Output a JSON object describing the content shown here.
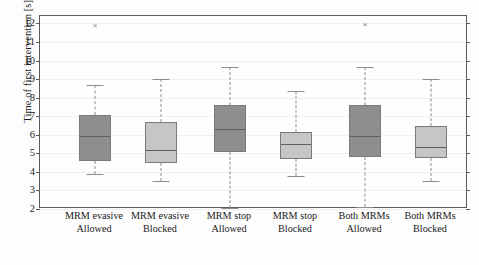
{
  "chart_data": {
    "type": "box",
    "title": "",
    "xlabel": "",
    "ylabel": "Time of first intervention [s]",
    "ylim": [
      2,
      12.4
    ],
    "yticks": [
      2,
      3,
      4,
      5,
      6,
      7,
      8,
      9,
      10,
      11,
      12
    ],
    "ytick_labels": [
      "2",
      "3",
      "4",
      "5",
      "6",
      "7",
      "8",
      "9",
      "10",
      "11",
      "12"
    ],
    "grid": true,
    "legend": "none",
    "categories": [
      {
        "line1": "MRM evasive",
        "line2": "Allowed"
      },
      {
        "line1": "MRM evasive",
        "line2": "Blocked"
      },
      {
        "line1": "MRM stop",
        "line2": "Allowed"
      },
      {
        "line1": "MRM stop",
        "line2": "Blocked"
      },
      {
        "line1": "Both MRMs",
        "line2": "Allowed"
      },
      {
        "line1": "Both MRMs",
        "line2": "Blocked"
      }
    ],
    "colors": {
      "allowed_fill": "#8e8e8e",
      "blocked_fill": "#c6c6c6",
      "box_edge": "#7a7a7a",
      "median": "#5f5f5f",
      "whisker": "#8c8c8c",
      "axis": "#5b5b5b",
      "grid": "#f0f0f0"
    },
    "boxes": [
      {
        "label": "MRM evasive Allowed",
        "group": "allowed",
        "fill": "#8e8e8e",
        "whisker_low": 3.88,
        "q1": 4.58,
        "median": 5.98,
        "q3": 7.08,
        "whisker_high": 8.66,
        "outliers": [
          11.9
        ]
      },
      {
        "label": "MRM evasive Blocked",
        "group": "blocked",
        "fill": "#c6c6c6",
        "whisker_low": 3.5,
        "q1": 4.5,
        "median": 5.24,
        "q3": 6.68,
        "whisker_high": 9.0,
        "outliers": []
      },
      {
        "label": "MRM stop Allowed",
        "group": "allowed",
        "fill": "#8e8e8e",
        "whisker_low": 2.08,
        "q1": 5.05,
        "median": 6.34,
        "q3": 7.6,
        "whisker_high": 9.64,
        "outliers": []
      },
      {
        "label": "MRM stop Blocked",
        "group": "blocked",
        "fill": "#c6c6c6",
        "whisker_low": 3.76,
        "q1": 4.72,
        "median": 5.56,
        "q3": 6.14,
        "whisker_high": 8.34,
        "outliers": []
      },
      {
        "label": "Both MRMs Allowed",
        "group": "allowed",
        "fill": "#8e8e8e",
        "whisker_low": 2.1,
        "q1": 4.78,
        "median": 5.98,
        "q3": 7.6,
        "whisker_high": 9.64,
        "outliers": [
          11.95
        ]
      },
      {
        "label": "Both MRMs Blocked",
        "group": "blocked",
        "fill": "#c6c6c6",
        "whisker_low": 3.52,
        "q1": 4.74,
        "median": 5.42,
        "q3": 6.48,
        "whisker_high": 9.0,
        "outliers": []
      }
    ]
  },
  "caption": {
    "text": ""
  }
}
